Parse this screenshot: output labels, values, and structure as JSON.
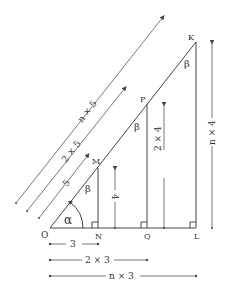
{
  "diagram": {
    "title": "",
    "points": {
      "O": {
        "label": "O",
        "x": 50,
        "y": 228
      },
      "N": {
        "label": "N",
        "x": 98,
        "y": 228
      },
      "Q": {
        "label": "Q",
        "x": 147,
        "y": 228
      },
      "L": {
        "label": "L",
        "x": 196,
        "y": 228
      },
      "M": {
        "label": "M",
        "x": 98,
        "y": 168
      },
      "P": {
        "label": "P",
        "x": 147,
        "y": 104
      },
      "K": {
        "label": "K",
        "x": 196,
        "y": 42
      }
    },
    "angles": {
      "alpha": "α",
      "beta": "β"
    },
    "dimensions": {
      "hyp_small": "5",
      "hyp_mid": "2 × 5",
      "hyp_large": "n × 5",
      "vert_small": "4",
      "vert_mid": "2 × 4",
      "vert_large": "n × 4",
      "base_small": "3",
      "base_mid": "2 × 3",
      "base_large": "n × 3"
    },
    "colors": {
      "line": "#444444",
      "text": "#333333",
      "background": "#ffffff"
    }
  }
}
